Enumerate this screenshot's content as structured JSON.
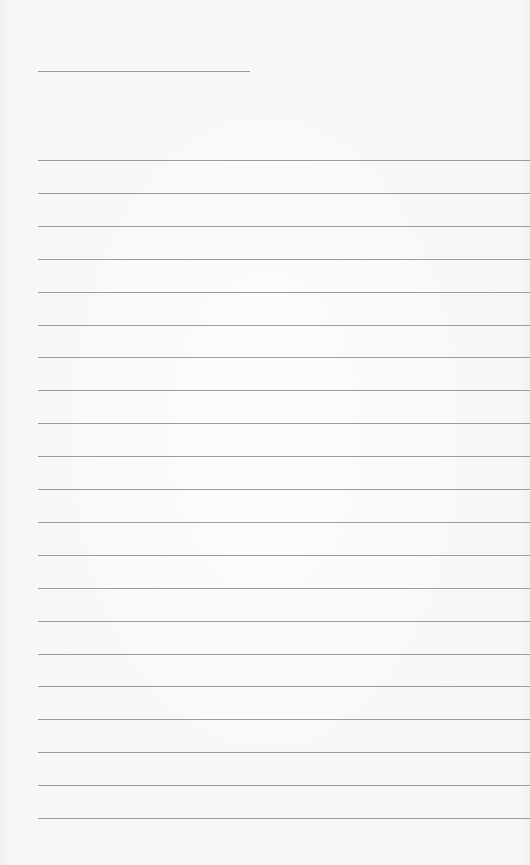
{
  "page": {
    "type": "lined-paper",
    "background_color": "#f7f7f7",
    "line_color": "#8d8d8d",
    "title_line": {
      "x": 38,
      "y": 71,
      "width": 212
    },
    "rules": {
      "x": 38,
      "start_y": 160,
      "spacing": 32.9,
      "count": 21,
      "right_edge": 530
    }
  }
}
